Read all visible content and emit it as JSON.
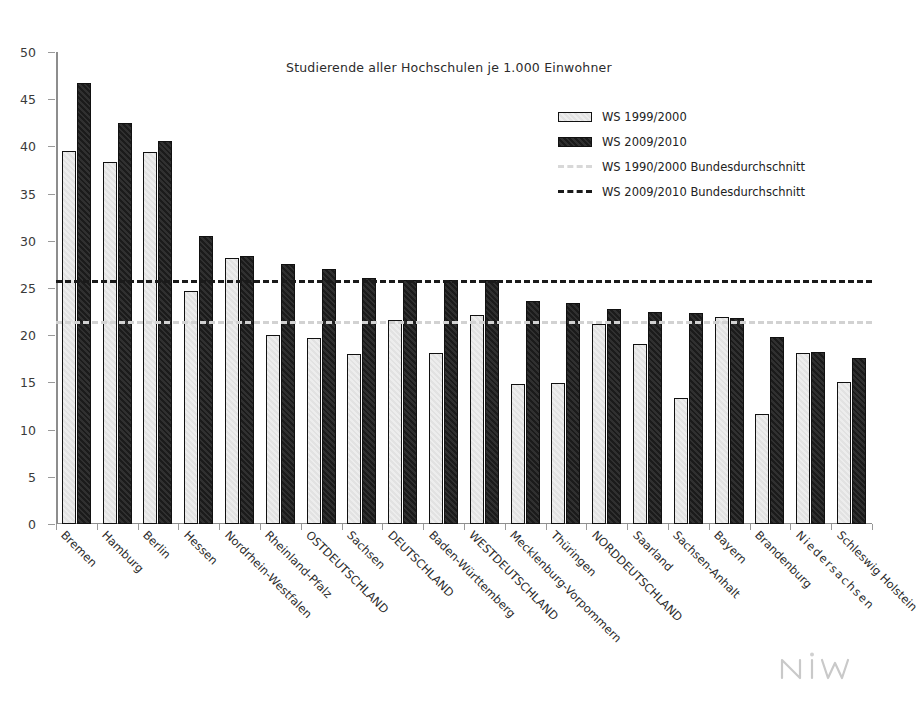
{
  "chart_data": {
    "type": "bar",
    "title": "Studierende aller Hochschulen je 1.000 Einwohner",
    "xlabel": "",
    "ylabel": "",
    "ylim": [
      0,
      50
    ],
    "yticks": [
      0,
      5,
      10,
      15,
      20,
      25,
      30,
      35,
      40,
      45,
      50
    ],
    "grid": false,
    "legend_position": "top-right",
    "categories": [
      "Bremen",
      "Hamburg",
      "Berlin",
      "Hessen",
      "Nordrhein-Westfalen",
      "Rheinland-Pfalz",
      "OSTDEUTSCHLAND",
      "Sachsen",
      "DEUTSCHLAND",
      "Baden-Württemberg",
      "WESTDEUTSCHLAND",
      "Mecklenburg-Vorpommern",
      "Thüringen",
      "NORDDEUTSCHLAND",
      "Saarland",
      "Sachsen-Anhalt",
      "Bayern",
      "Brandenburg",
      "Niedersachsen",
      "Schleswig Holstein"
    ],
    "series": [
      {
        "name": "WS 1999/2000",
        "values": [
          39.5,
          38.3,
          39.4,
          24.7,
          28.2,
          20.0,
          19.7,
          18.0,
          21.6,
          18.1,
          22.1,
          14.8,
          14.9,
          21.2,
          19.1,
          13.4,
          21.9,
          11.7,
          18.1,
          15.0
        ]
      },
      {
        "name": "WS 2009/2010",
        "values": [
          46.7,
          42.5,
          40.6,
          30.5,
          28.4,
          27.5,
          27.0,
          26.1,
          25.9,
          25.9,
          25.9,
          23.6,
          23.4,
          22.8,
          22.5,
          22.4,
          21.8,
          19.8,
          18.2,
          17.6
        ]
      }
    ],
    "reference_lines": [
      {
        "name": "WS 1990/2000 Bundesdurchschnitt",
        "value": 21.5,
        "style": "dashed",
        "color": "#d2d2d2"
      },
      {
        "name": "WS 2009/2010 Bundesdurchschnitt",
        "value": 25.9,
        "style": "dashed",
        "color": "#1a1a1a"
      }
    ],
    "legend": [
      {
        "label": "WS 1999/2000",
        "marker": "bar-light"
      },
      {
        "label": "WS 2009/2010",
        "marker": "bar-dark"
      },
      {
        "label": "WS 1990/2000 Bundesdurchschnitt",
        "marker": "dashed-light"
      },
      {
        "label": "WS 2009/2010  Bundesdurchschnitt",
        "marker": "dashed-dark"
      }
    ]
  },
  "logo": {
    "text": "niw"
  },
  "colors": {
    "bar_light": "#e8e8e8",
    "bar_dark": "#1f1f1f",
    "avg_1999": "#d2d2d2",
    "avg_2009": "#1a1a1a",
    "axis": "#8d8d8d",
    "text": "#2b2b2b"
  }
}
